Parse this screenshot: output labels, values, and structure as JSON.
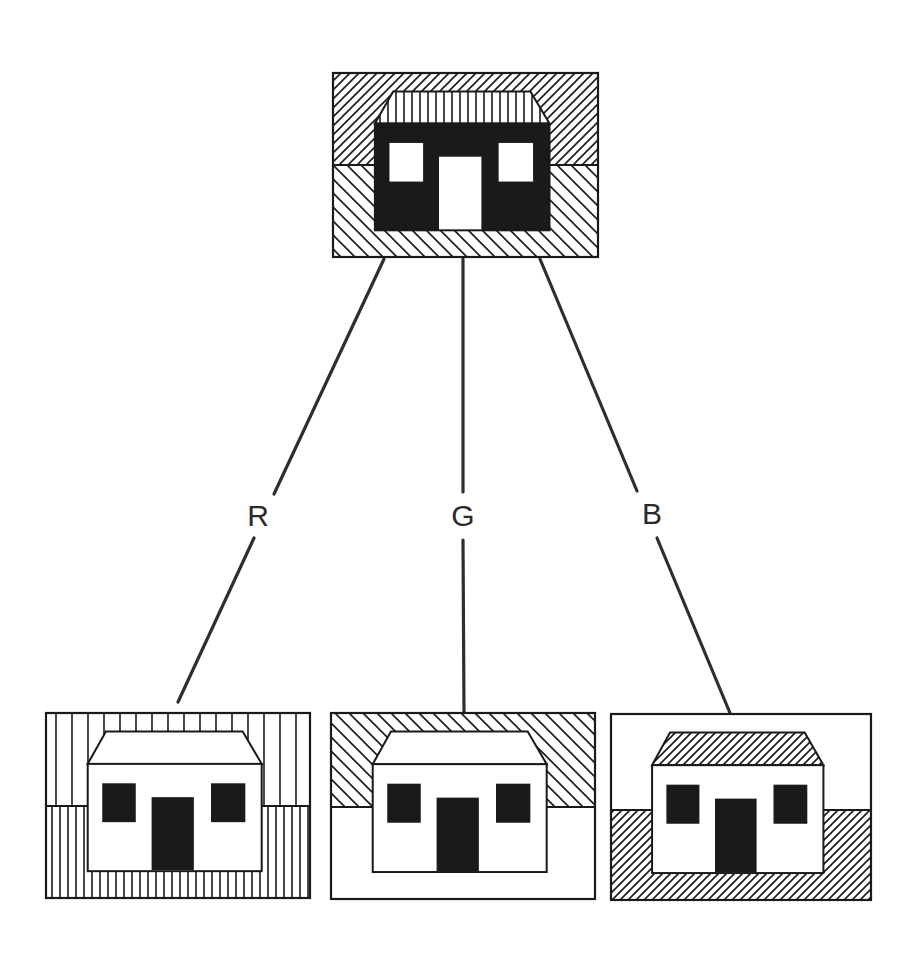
{
  "diagram": {
    "title": "",
    "colors": {
      "ink": "#1a1a1a",
      "line": "#2e2e2e",
      "paper": "#ffffff"
    },
    "patterns": {
      "diag_up_dense": {
        "direction": "/",
        "spacing": 9
      },
      "diag_down_wide": {
        "direction": "\\",
        "spacing": 14
      },
      "vertical_roof": {
        "direction": "|",
        "spacing": 8
      },
      "vertical_sparse": {
        "direction": "|",
        "spacing": 16
      },
      "vertical_dense": {
        "direction": "|",
        "spacing": 8
      },
      "diag_up_fine": {
        "direction": "/",
        "spacing": 8
      }
    },
    "source_image": {
      "name": "composite",
      "box": [
        333,
        73,
        598,
        257
      ],
      "horizon_y": 165,
      "sky": "diag_up_dense",
      "ground": "diag_down_wide",
      "roof": "vertical_roof",
      "body": "black",
      "windows": "white",
      "door": "white"
    },
    "channels": [
      {
        "label": "R",
        "label_pos": [
          258,
          516
        ],
        "line_upper": [
          [
            384,
            259
          ],
          [
            274,
            494
          ]
        ],
        "line_lower": [
          [
            254,
            538
          ],
          [
            178,
            702
          ]
        ],
        "image": {
          "box": [
            46,
            713,
            310,
            898
          ],
          "horizon_y": 806,
          "sky": "vertical_sparse",
          "ground": "vertical_dense",
          "roof": "white",
          "body": "white",
          "windows": "black",
          "door": "black"
        }
      },
      {
        "label": "G",
        "label_pos": [
          463,
          516
        ],
        "line_upper": [
          [
            463,
            259
          ],
          [
            463,
            492
          ]
        ],
        "line_lower": [
          [
            463,
            540
          ],
          [
            464,
            713
          ]
        ],
        "image": {
          "box": [
            331,
            713,
            595,
            899
          ],
          "horizon_y": 807,
          "sky": "diag_down_wide",
          "ground": "white",
          "roof": "white",
          "body": "white",
          "windows": "black",
          "door": "black"
        }
      },
      {
        "label": "B",
        "label_pos": [
          652,
          514
        ],
        "line_upper": [
          [
            540,
            259
          ],
          [
            637,
            491
          ]
        ],
        "line_lower": [
          [
            657,
            538
          ],
          [
            730,
            713
          ]
        ],
        "image": {
          "box": [
            611,
            714,
            871,
            900
          ],
          "horizon_y": 810,
          "sky": "white",
          "ground": "diag_up_fine",
          "roof": "diag_up_fine",
          "body": "white",
          "windows": "black",
          "door": "black"
        }
      }
    ]
  }
}
